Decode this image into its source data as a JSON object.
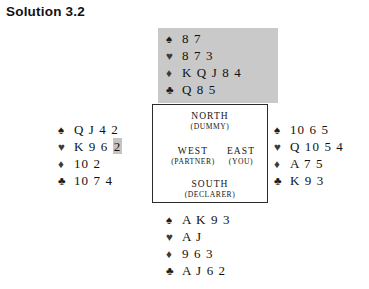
{
  "title": "Solution 3.2",
  "suit_symbols": {
    "spade": "♠",
    "heart": "♥",
    "diamond": "♦",
    "club": "♣"
  },
  "compass": {
    "north": {
      "name": "NORTH",
      "role": "(DUMMY)"
    },
    "west": {
      "name": "WEST",
      "role": "(PARTNER)"
    },
    "east": {
      "name": "EAST",
      "role": "(YOU)"
    },
    "south": {
      "name": "SOUTH",
      "role": "(DECLARER)"
    }
  },
  "hands": {
    "north": {
      "spades": "8 7",
      "hearts": "8 7 3",
      "diamonds": "K Q J 8 4",
      "clubs": "Q 8 5"
    },
    "west": {
      "spades": "Q J 4 2",
      "hearts_plain": "K 9 6 ",
      "hearts_marked": "2",
      "diamonds": "10 2",
      "clubs": "10 7 4"
    },
    "east": {
      "spades": "10 6 5",
      "hearts": "Q 10 5 4",
      "diamonds": "A 7 5",
      "clubs": "K 9 3"
    },
    "south": {
      "spades": "A K 9 3",
      "hearts": "A J",
      "diamonds": "9 6 3",
      "clubs": "A J 6 2"
    }
  },
  "colors": {
    "page_background": "#ffffff",
    "north_panel": "#c9c9c9",
    "highlight": "#c4c4c4",
    "box_border": "#2b2b2b",
    "text": "#111111"
  }
}
